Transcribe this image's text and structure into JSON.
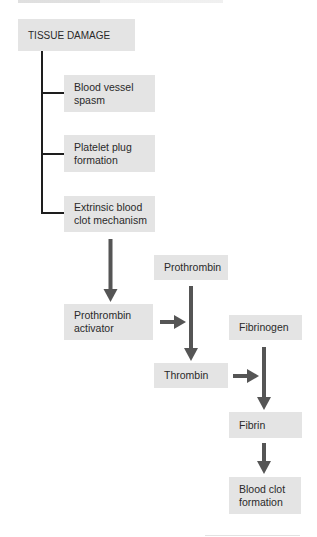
{
  "diagram": {
    "title_box": "TISSUE DAMAGE",
    "branches": [
      "Blood vessel\nspasm",
      "Platelet plug\nformation",
      "Extrinsic blood\nclot mechanism"
    ],
    "cascade": {
      "prothrombin_activator": "Prothrombin\nactivator",
      "prothrombin": "Prothrombin",
      "thrombin": "Thrombin",
      "fibrinogen": "Fibrinogen",
      "fibrin": "Fibrin",
      "blood_clot": "Blood clot\nformation"
    },
    "colors": {
      "box_fill": "#e4e4e4",
      "arrow": "#555555",
      "connector": "#1e1e1e"
    }
  }
}
